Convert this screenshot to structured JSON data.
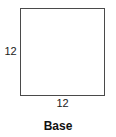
{
  "figure": {
    "caption": "Base",
    "shape": {
      "name": "square",
      "stroke_color": "#4a4a4a",
      "fill_color": "transparent"
    },
    "labels": {
      "left_side": "12",
      "bottom_side": "12"
    },
    "text_color": "#1a1a1a",
    "background_color": "#ffffff"
  }
}
